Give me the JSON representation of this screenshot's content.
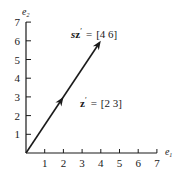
{
  "diagram": {
    "title": "",
    "origin_px": [
      26,
      153
    ],
    "unit_px": 18.7,
    "x_axis": {
      "name": "e",
      "subscript": "1",
      "ticks": [
        1,
        2,
        3,
        4,
        5,
        6,
        7
      ],
      "tick_labels": [
        "1",
        "2",
        "3",
        "4",
        "5",
        "6",
        "7"
      ],
      "max": 7
    },
    "y_axis": {
      "name": "e",
      "subscript": "2",
      "ticks": [
        1,
        2,
        3,
        4,
        5,
        6,
        7
      ],
      "tick_labels": [
        "1",
        "2",
        "3",
        "4",
        "5",
        "6",
        "7"
      ],
      "max": 7
    },
    "vectors": [
      {
        "name": "sz'",
        "prefix": "s",
        "symbol": "z",
        "prime": "′",
        "equals": "=",
        "value_text": "[4 6]",
        "components": [
          4,
          6
        ],
        "label_pos": [
          71,
          38
        ]
      },
      {
        "name": "z'",
        "prefix": "",
        "symbol": "z",
        "prime": "′",
        "equals": "=",
        "value_text": "[2 3]",
        "components": [
          2,
          3
        ],
        "label_pos": [
          80,
          107
        ]
      }
    ],
    "colors": {
      "ink": "#1a1a1a",
      "background": "#ffffff"
    }
  }
}
